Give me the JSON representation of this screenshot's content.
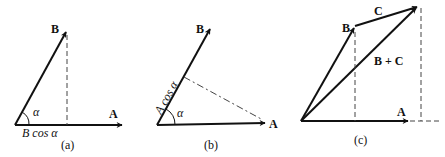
{
  "figure": {
    "panels": [
      {
        "id": "a",
        "caption": "(a)",
        "vector_labels": {
          "B": "B",
          "A": "A"
        },
        "angle_label": "α",
        "projection_label": "B cos α"
      },
      {
        "id": "b",
        "caption": "(b)",
        "vector_labels": {
          "B": "B",
          "A": "A"
        },
        "angle_label": "α",
        "projection_label": "A cos α"
      },
      {
        "id": "c",
        "caption": "(c)",
        "vector_labels": {
          "B": "B",
          "C": "C",
          "sum": "B + C",
          "A": "A"
        }
      }
    ],
    "colors": {
      "ink": "#111111",
      "background": "#ffffff"
    }
  }
}
